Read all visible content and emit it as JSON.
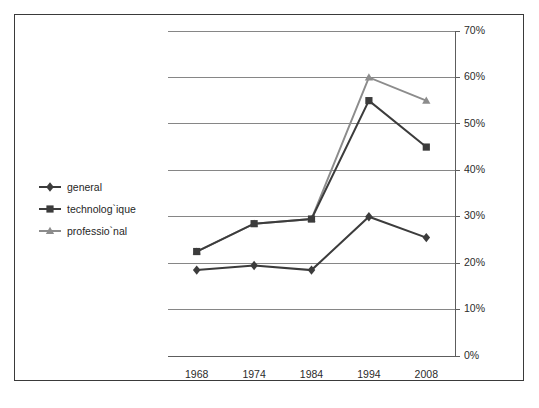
{
  "chart_data": {
    "type": "line",
    "title": "",
    "xlabel": "",
    "ylabel": "",
    "categories": [
      "1968",
      "1974",
      "1984",
      "1994",
      "2008"
    ],
    "ylim": [
      0,
      70
    ],
    "y_tick_labels": [
      "0%",
      "10%",
      "20%",
      "30%",
      "40%",
      "50%",
      "60%",
      "70%"
    ],
    "y_ticks": [
      0,
      10,
      20,
      30,
      40,
      50,
      60,
      70
    ],
    "y_axis_position": "right",
    "grid": "horizontal",
    "legend_position": "inside-left",
    "series": [
      {
        "name": "general",
        "marker": "diamond",
        "color": "#3c3c3c",
        "values": [
          18.5,
          19.5,
          18.5,
          30.0,
          25.5
        ]
      },
      {
        "name": "technolog`ique",
        "marker": "square",
        "color": "#3c3c3c",
        "values": [
          22.5,
          28.5,
          29.5,
          55.0,
          45.0
        ]
      },
      {
        "name": "professio`nal",
        "marker": "triangle",
        "color": "#8c8c8c",
        "values": [
          22.5,
          28.5,
          29.5,
          60.0,
          55.0
        ]
      }
    ]
  },
  "legend": {
    "items": [
      {
        "label": "general"
      },
      {
        "label": "technolog`ique"
      },
      {
        "label": "professio`nal"
      }
    ]
  },
  "caption": {
    "text": ""
  },
  "colors": {
    "series_dark": "#3c3c3c",
    "series_gray": "#8c8c8c",
    "gridline": "#868686",
    "axis": "#5d5d5d",
    "frame_border": "#3a3a3a",
    "background": "#ffffff"
  }
}
